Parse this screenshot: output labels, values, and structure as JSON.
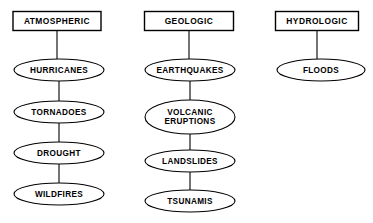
{
  "diagram": {
    "type": "classification-tree",
    "background_color": "#ffffff",
    "stroke_color": "#000000",
    "text_color": "#000000",
    "columns": [
      {
        "id": "atmospheric",
        "header": {
          "label": "ATMOSPHERIC",
          "shape": "rectangle",
          "cx": 57,
          "cy": 21,
          "width": 88,
          "height": 19
        },
        "nodes": [
          {
            "label": "HURRICANES",
            "shape": "ellipse",
            "cx": 59,
            "cy": 70,
            "rx": 45,
            "ry": 11,
            "lines": [
              "HURRICANES"
            ]
          },
          {
            "label": "TORNADOES",
            "shape": "ellipse",
            "cx": 59,
            "cy": 112,
            "rx": 45,
            "ry": 11,
            "lines": [
              "TORNADOES"
            ]
          },
          {
            "label": "DROUGHT",
            "shape": "ellipse",
            "cx": 59,
            "cy": 153,
            "rx": 45,
            "ry": 11,
            "lines": [
              "DROUGHT"
            ]
          },
          {
            "label": "WILDFIRES",
            "shape": "ellipse",
            "cx": 59,
            "cy": 194,
            "rx": 45,
            "ry": 11,
            "lines": [
              "WILDFIRES"
            ]
          }
        ],
        "connectors": [
          {
            "x": 57,
            "y1": 30,
            "y2": 59
          },
          {
            "x": 59,
            "y1": 81,
            "y2": 101
          },
          {
            "x": 59,
            "y1": 123,
            "y2": 142
          },
          {
            "x": 59,
            "y1": 164,
            "y2": 183
          }
        ]
      },
      {
        "id": "geologic",
        "header": {
          "label": "GEOLOGIC",
          "shape": "rectangle",
          "cx": 189,
          "cy": 21,
          "width": 89,
          "height": 19
        },
        "nodes": [
          {
            "label": "EARTHQUAKES",
            "shape": "ellipse",
            "cx": 190,
            "cy": 70,
            "rx": 45,
            "ry": 11,
            "lines": [
              "EARTHQUAKES"
            ]
          },
          {
            "label": "VOLCANIC ERUPTIONS",
            "shape": "ellipse",
            "cx": 190,
            "cy": 117,
            "rx": 45,
            "ry": 17,
            "lines": [
              "VOLCANIC",
              "ERUPTIONS"
            ]
          },
          {
            "label": "LANDSLIDES",
            "shape": "ellipse",
            "cx": 190,
            "cy": 161,
            "rx": 45,
            "ry": 11,
            "lines": [
              "LANDSLIDES"
            ]
          },
          {
            "label": "TSUNAMIS",
            "shape": "ellipse",
            "cx": 190,
            "cy": 201,
            "rx": 45,
            "ry": 11,
            "lines": [
              "TSUNAMIS"
            ]
          }
        ],
        "connectors": [
          {
            "x": 189,
            "y1": 30,
            "y2": 59
          },
          {
            "x": 190,
            "y1": 81,
            "y2": 100
          },
          {
            "x": 190,
            "y1": 134,
            "y2": 150
          },
          {
            "x": 190,
            "y1": 172,
            "y2": 190
          }
        ]
      },
      {
        "id": "hydrologic",
        "header": {
          "label": "HYDROLOGIC",
          "shape": "rectangle",
          "cx": 317,
          "cy": 21,
          "width": 83,
          "height": 19
        },
        "nodes": [
          {
            "label": "FLOODS",
            "shape": "ellipse",
            "cx": 321,
            "cy": 70,
            "rx": 44,
            "ry": 11,
            "lines": [
              "FLOODS"
            ]
          }
        ],
        "connectors": [
          {
            "x": 317,
            "y1": 30,
            "y2": 59
          }
        ]
      }
    ]
  }
}
